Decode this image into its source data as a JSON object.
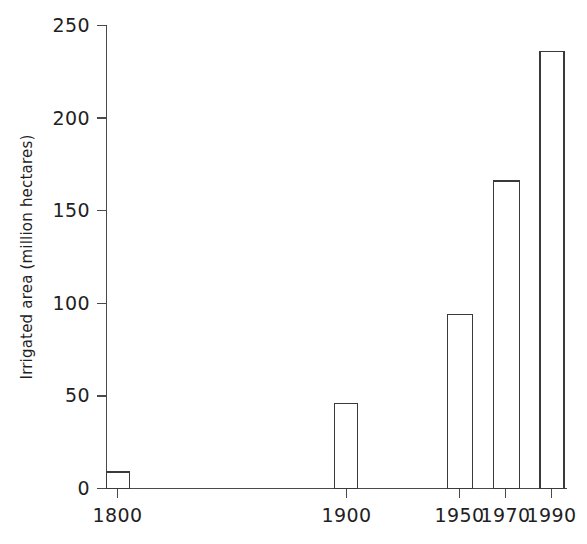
{
  "chart_data": {
    "type": "bar",
    "title": "",
    "subtitle": "",
    "xlabel": "",
    "ylabel": "Irrigated area (million hectares)",
    "categories": [
      "1800",
      "1900",
      "1950",
      "1970",
      "1990"
    ],
    "values": [
      9,
      46,
      94,
      166,
      236
    ],
    "series": [
      {
        "name": "Irrigated area",
        "values": [
          9,
          46,
          94,
          166,
          236
        ]
      }
    ],
    "xlim": [
      1790,
      2000
    ],
    "ylim": [
      0,
      250
    ],
    "y_ticks": [
      0,
      50,
      100,
      150,
      200,
      250
    ],
    "y_tick_labels": [
      "0",
      "50",
      "100",
      "150",
      "200",
      "250"
    ],
    "x_ticks": [
      1800,
      1900,
      1950,
      1970,
      1990
    ],
    "x_tick_labels": [
      "1800",
      "1900",
      "1950",
      "1970",
      "1990"
    ],
    "grid": false,
    "legend": false,
    "legend_position": "none",
    "bar_fill_color": "#ffffff",
    "bar_edge_color": "#3a3a3a",
    "axis_color": "#4a4a4a",
    "background_color": "#ffffff",
    "annotations": []
  },
  "axis": {
    "y_title": "Irrigated area (million hectares)"
  }
}
